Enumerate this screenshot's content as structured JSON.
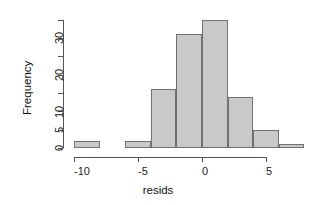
{
  "chart_data": {
    "type": "bar",
    "title": "",
    "xlabel": "resids",
    "ylabel": "Frequency",
    "bin_width": 2,
    "bin_edges": [
      -10,
      -8,
      -6,
      -4,
      -2,
      0,
      2,
      4,
      6,
      8
    ],
    "categories": [
      "-10 to -8",
      "-8 to -6",
      "-6 to -4",
      "-4 to -2",
      "-2 to 0",
      "0 to 2",
      "2 to 4",
      "4 to 6",
      "6 to 8"
    ],
    "values": [
      2,
      0,
      2,
      16,
      31,
      35,
      14,
      5,
      1
    ],
    "xlim": [
      -11,
      9
    ],
    "ylim": [
      0,
      36
    ],
    "x_ticks": [
      -10,
      -5,
      0,
      5
    ],
    "x_tick_labels": [
      "-10",
      "-5",
      "0",
      "5"
    ],
    "y_ticks": [
      0,
      5,
      10,
      15,
      20,
      25,
      30,
      35
    ],
    "y_tick_labels_shown": [
      {
        "value": 0,
        "label": "0"
      },
      {
        "value": 5,
        "label": "5"
      },
      {
        "value": 10,
        "label": "10"
      },
      {
        "value": 20,
        "label": "20"
      },
      {
        "value": 30,
        "label": "30"
      }
    ],
    "grid": false,
    "legend": null,
    "bar_fill_color": "#c9c9c9",
    "bar_border_color": "#707070",
    "axis_color": "#555555"
  },
  "axes": {
    "x_title": "resids",
    "y_title": "Frequency"
  }
}
